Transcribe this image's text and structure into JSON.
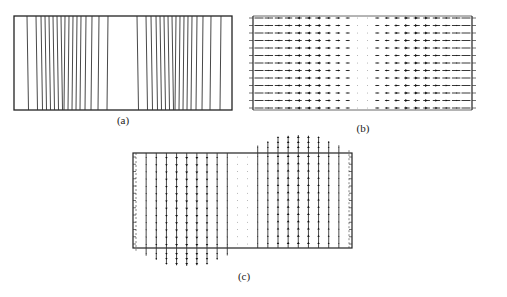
{
  "figure": {
    "panels": [
      {
        "id": "a",
        "label": "(a)",
        "kind": "contour-lines",
        "description": "Vertical contour lines inside a rectangle; dense on left and right halves, blank gap in center",
        "box": {
          "x": 14,
          "y": 16,
          "w": 218,
          "h": 94
        },
        "line_x_left": [
          27,
          36,
          41,
          45,
          49,
          53,
          57,
          61,
          65,
          69,
          73,
          77,
          81,
          86,
          92,
          99,
          108
        ],
        "line_x_right": [
          137,
          146,
          151,
          156,
          160,
          164,
          168,
          172,
          176,
          180,
          184,
          188,
          192,
          197,
          203,
          211,
          221
        ]
      },
      {
        "id": "b",
        "label": "(b)",
        "kind": "horizontal-vector-field",
        "description": "Horizontal arrows: left half points left, right half points right, weak near center",
        "box": {
          "x": 253,
          "y": 16,
          "w": 219,
          "h": 94
        },
        "rows": 13,
        "cols": 22
      },
      {
        "id": "c",
        "label": "(c)",
        "kind": "vertical-vector-field",
        "description": "Vertical arrows: left half points down (bulging below box), right half points up (bulging above box)",
        "box": {
          "x": 133,
          "y": 153,
          "w": 219,
          "h": 95
        },
        "rows": 13,
        "cols": 22
      }
    ]
  }
}
